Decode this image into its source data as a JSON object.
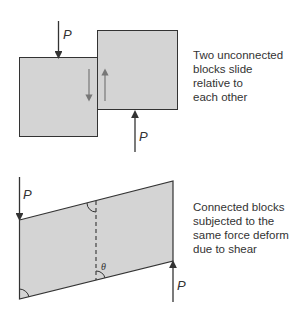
{
  "colors": {
    "block_fill": "#d4d4d4",
    "outline": "#333333",
    "inner_arrow": "#777777",
    "text": "#333333"
  },
  "top_diagram": {
    "caption": "Two unconnected\nblocks slide\nrelative to\neach other",
    "force_label_top": "P",
    "force_label_bottom": "P"
  },
  "bottom_diagram": {
    "caption": "Connected blocks\nsubjected to the\nsame force deform\ndue to shear",
    "force_label_top": "P",
    "force_label_bottom": "P",
    "angle_label": "θ"
  }
}
